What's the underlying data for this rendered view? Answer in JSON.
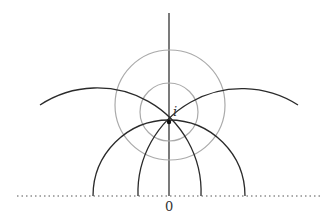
{
  "diagram": {
    "labels": {
      "point": "i",
      "origin": "0"
    },
    "colors": {
      "geodesic": "#2a2a2a",
      "circle": "#aaaaaa",
      "axis": "#333333"
    }
  }
}
